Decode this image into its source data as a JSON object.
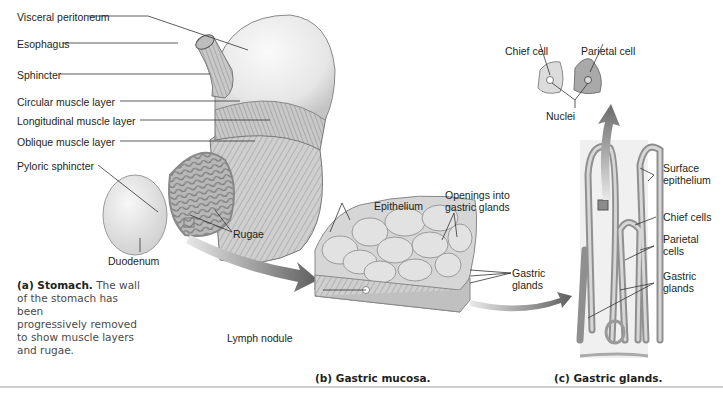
{
  "figure": {
    "title_cut_off": "",
    "panels": {
      "a": {
        "caption_bold": "(a) Stomach.",
        "caption_text": "The wall of the stomach has been progressively removed to show muscle layers and rugae.",
        "caption_lines": [
          "The wall",
          "of the stomach has been",
          "progressively removed",
          "to show muscle layers",
          "and rugae."
        ],
        "labels": {
          "visceral_peritoneum": "Visceral peritoneum",
          "esophagus": "Esophagus",
          "sphincter": "Sphincter",
          "circular_muscle": "Circular muscle layer",
          "longitudinal_muscle": "Longitudinal muscle layer",
          "oblique_muscle": "Oblique muscle layer",
          "pyloric_sphincter": "Pyloric sphincter",
          "duodenum": "Duodenum",
          "rugae": "Rugae"
        }
      },
      "b": {
        "caption": "(b) Gastric mucosa.",
        "labels": {
          "epithelium": "Epithelium",
          "openings": "Openings into",
          "openings2": "gastric glands",
          "gastric_glands": "Gastric",
          "gastric_glands2": "glands",
          "lymph_nodule": "Lymph nodule"
        }
      },
      "c": {
        "caption": "(c) Gastric glands.",
        "labels": {
          "chief_cell": "Chief cell",
          "parietal_cell": "Parietal cell",
          "nuclei": "Nuclei",
          "surface_epithelium": "Surface",
          "surface_epithelium2": "epithelium",
          "chief_cells": "Chief cells",
          "parietal_cells": "Parietal",
          "parietal_cells2": "cells",
          "gastric_glands": "Gastric",
          "gastric_glands2": "glands"
        }
      }
    },
    "colors": {
      "arrow": "#6e6e6e",
      "tissue": "#d9d9d9",
      "tissue_dark": "#9a9a9a",
      "line": "#333333"
    }
  }
}
